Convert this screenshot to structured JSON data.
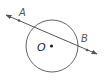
{
  "diagram": {
    "type": "circle-with-secant-line",
    "circle": {
      "center_label": "O",
      "cx": 52,
      "cy": 46,
      "r": 26
    },
    "line": {
      "x1": 6,
      "y1": 15,
      "x2": 97,
      "y2": 54,
      "arrows": "both"
    },
    "points": [
      {
        "label": "A",
        "x": 19,
        "y": 20,
        "label_x": 20,
        "label_y": 17
      },
      {
        "label": "B",
        "x": 87,
        "y": 50,
        "label_x": 82,
        "label_y": 43
      }
    ],
    "center_point": {
      "label": "O",
      "x": 51,
      "y": 46,
      "label_x": 37,
      "label_y": 51
    },
    "colors": {
      "stroke": "#555555",
      "label": "#555555"
    }
  }
}
